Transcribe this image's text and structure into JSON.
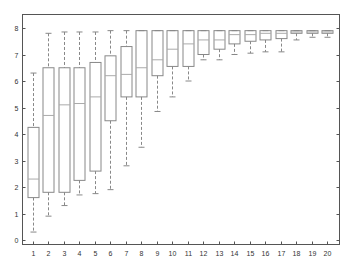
{
  "chart_data": {
    "type": "box",
    "title": "",
    "xlabel": "",
    "ylabel": "",
    "ylim": [
      -0.1,
      8.45
    ],
    "yticks": [
      0,
      1,
      2,
      3,
      4,
      5,
      6,
      7,
      8
    ],
    "categories": [
      "1",
      "2",
      "3",
      "4",
      "5",
      "6",
      "7",
      "8",
      "9",
      "10",
      "11",
      "12",
      "13",
      "14",
      "15",
      "16",
      "17",
      "18",
      "19",
      "20"
    ],
    "grid": false,
    "legend": null,
    "boxes": [
      {
        "label": "1",
        "whisker_low": 0.3,
        "q1": 1.6,
        "median": 2.3,
        "q3": 4.25,
        "whisker_high": 6.3
      },
      {
        "label": "2",
        "whisker_low": 0.9,
        "q1": 1.8,
        "median": 4.7,
        "q3": 6.5,
        "whisker_high": 7.8
      },
      {
        "label": "3",
        "whisker_low": 1.3,
        "q1": 1.8,
        "median": 5.1,
        "q3": 6.5,
        "whisker_high": 7.85
      },
      {
        "label": "4",
        "whisker_low": 1.7,
        "q1": 2.25,
        "median": 5.15,
        "q3": 6.5,
        "whisker_high": 7.85
      },
      {
        "label": "5",
        "whisker_low": 1.75,
        "q1": 2.6,
        "median": 5.4,
        "q3": 6.7,
        "whisker_high": 7.85
      },
      {
        "label": "6",
        "whisker_low": 1.9,
        "q1": 4.5,
        "median": 6.2,
        "q3": 6.95,
        "whisker_high": 7.9
      },
      {
        "label": "7",
        "whisker_low": 2.8,
        "q1": 5.4,
        "median": 6.25,
        "q3": 7.3,
        "whisker_high": 7.9
      },
      {
        "label": "8",
        "whisker_low": 3.5,
        "q1": 5.4,
        "median": 6.5,
        "q3": 7.9,
        "whisker_high": 7.9
      },
      {
        "label": "9",
        "whisker_low": 4.85,
        "q1": 6.2,
        "median": 6.8,
        "q3": 7.9,
        "whisker_high": 7.9
      },
      {
        "label": "10",
        "whisker_low": 5.4,
        "q1": 6.55,
        "median": 7.2,
        "q3": 7.9,
        "whisker_high": 7.9
      },
      {
        "label": "11",
        "whisker_low": 6.0,
        "q1": 6.55,
        "median": 7.4,
        "q3": 7.9,
        "whisker_high": 7.9
      },
      {
        "label": "12",
        "whisker_low": 6.8,
        "q1": 7.0,
        "median": 7.55,
        "q3": 7.9,
        "whisker_high": 7.9
      },
      {
        "label": "13",
        "whisker_low": 6.8,
        "q1": 7.2,
        "median": 7.55,
        "q3": 7.9,
        "whisker_high": 7.9
      },
      {
        "label": "14",
        "whisker_low": 7.0,
        "q1": 7.4,
        "median": 7.75,
        "q3": 7.9,
        "whisker_high": 7.9
      },
      {
        "label": "15",
        "whisker_low": 7.05,
        "q1": 7.5,
        "median": 7.75,
        "q3": 7.9,
        "whisker_high": 7.9
      },
      {
        "label": "16",
        "whisker_low": 7.1,
        "q1": 7.55,
        "median": 7.8,
        "q3": 7.9,
        "whisker_high": 7.9
      },
      {
        "label": "17",
        "whisker_low": 7.1,
        "q1": 7.6,
        "median": 7.8,
        "q3": 7.9,
        "whisker_high": 7.9
      },
      {
        "label": "18",
        "whisker_low": 7.55,
        "q1": 7.8,
        "median": 7.85,
        "q3": 7.9,
        "whisker_high": 7.9
      },
      {
        "label": "19",
        "whisker_low": 7.65,
        "q1": 7.8,
        "median": 7.85,
        "q3": 7.9,
        "whisker_high": 7.9
      },
      {
        "label": "20",
        "whisker_low": 7.65,
        "q1": 7.8,
        "median": 7.85,
        "q3": 7.9,
        "whisker_high": 7.9
      }
    ],
    "colors": {
      "axis": "#555555",
      "box": "#888888",
      "whisker": "#888888",
      "median": "#aaaaaa",
      "text": "#333333"
    }
  }
}
